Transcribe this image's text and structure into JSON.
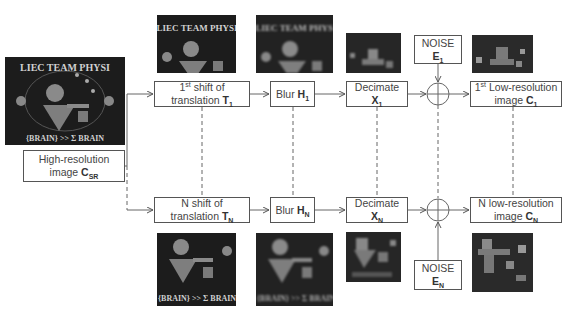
{
  "diagram": {
    "source": {
      "label_line1": "High-resolution",
      "label_line2": "image ",
      "symbol": "C",
      "subscript": "SR"
    },
    "top_path": {
      "shift": {
        "line1_pre": "1",
        "line1_sup": "st",
        "line1_post": " shift of",
        "line2": "translation ",
        "symbol": "T",
        "subscript": "1"
      },
      "blur": {
        "text": "Blur ",
        "symbol": "H",
        "subscript": "1"
      },
      "decimate": {
        "line1": "Decimate",
        "symbol": "X",
        "subscript": "1"
      },
      "noise": {
        "line1": "NOISE",
        "symbol": "E",
        "subscript": "1"
      },
      "output": {
        "line1_pre": "1",
        "line1_sup": "st",
        "line1_post": " Low-resolution",
        "line2": "image ",
        "symbol": "C",
        "subscript": "1"
      }
    },
    "bottom_path": {
      "shift": {
        "line1": "N shift of",
        "line2": "translation ",
        "symbol": "T",
        "subscript": "N"
      },
      "blur": {
        "text": "Blur ",
        "symbol": "H",
        "subscript": "N"
      },
      "decimate": {
        "line1": "Decimate",
        "symbol": "X",
        "subscript": "N"
      },
      "noise": {
        "line1": "NOISE",
        "symbol": "E",
        "subscript": "N"
      },
      "output": {
        "line1": "N low-resolution",
        "line2": "image ",
        "symbol": "C",
        "subscript": "N"
      }
    },
    "image_text": {
      "arc_top": "LIEC TEAM PHYSI",
      "arc_bottom": "{BRAIN} >> Σ BRAIN",
      "formula": "Φ¹¹"
    },
    "summation_symbol": "⊕"
  }
}
